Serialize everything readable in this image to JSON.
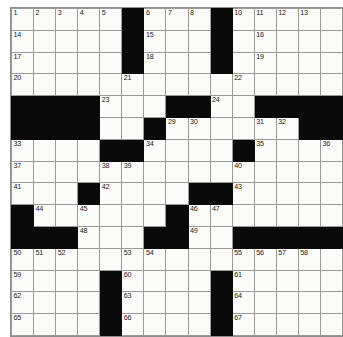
{
  "puzzle": {
    "title": "Crossword Grid",
    "size": {
      "rows": 15,
      "cols": 15
    },
    "colors": {
      "block": "#0a0a0a",
      "cell": "#fbfbf9",
      "gridline": "#9a9a9a",
      "number_text": "#1a1a1a",
      "page_background": "#ffffff"
    },
    "layout": {
      "grid_left_px": 11,
      "grid_top_px": 8,
      "cell_size_px": 21.4
    },
    "legend": {
      "block_symbol": "#",
      "open_symbol": "."
    },
    "grid_pattern": [
      ".....#....#.....",
      ".....#....#.....",
      ".....#....#.....",
      "...............",
      "####...##..#####",
      "....#.#....##..#",
      "....##....#...#.",
      "...............",
      "...#.....##.....",
      "#.........#.....",
      "###..##..##.....",
      ".........#.....",
      "....#....#.....",
      "....#....#.....",
      "....#....#....."
    ],
    "blocks": [
      [
        0,
        5
      ],
      [
        0,
        9
      ],
      [
        1,
        5
      ],
      [
        1,
        9
      ],
      [
        2,
        5
      ],
      [
        2,
        9
      ],
      [
        4,
        0
      ],
      [
        4,
        1
      ],
      [
        4,
        2
      ],
      [
        4,
        3
      ],
      [
        4,
        7
      ],
      [
        4,
        8
      ],
      [
        4,
        11
      ],
      [
        4,
        12
      ],
      [
        4,
        13
      ],
      [
        4,
        14
      ],
      [
        5,
        0
      ],
      [
        5,
        1
      ],
      [
        5,
        2
      ],
      [
        5,
        3
      ],
      [
        5,
        6
      ],
      [
        5,
        13
      ],
      [
        5,
        14
      ],
      [
        6,
        4
      ],
      [
        6,
        5
      ],
      [
        6,
        10
      ],
      [
        8,
        3
      ],
      [
        8,
        8
      ],
      [
        8,
        9
      ],
      [
        9,
        0
      ],
      [
        9,
        7
      ],
      [
        10,
        0
      ],
      [
        10,
        1
      ],
      [
        10,
        2
      ],
      [
        10,
        6
      ],
      [
        10,
        7
      ],
      [
        10,
        10
      ],
      [
        10,
        11
      ],
      [
        10,
        12
      ],
      [
        10,
        13
      ],
      [
        10,
        14
      ],
      [
        12,
        4
      ],
      [
        12,
        9
      ],
      [
        13,
        4
      ],
      [
        13,
        9
      ],
      [
        14,
        4
      ],
      [
        14,
        9
      ]
    ],
    "numbers": [
      {
        "row": 0,
        "col": 0,
        "n": "1"
      },
      {
        "row": 0,
        "col": 1,
        "n": "2"
      },
      {
        "row": 0,
        "col": 2,
        "n": "3"
      },
      {
        "row": 0,
        "col": 3,
        "n": "4"
      },
      {
        "row": 0,
        "col": 4,
        "n": "5"
      },
      {
        "row": 0,
        "col": 6,
        "n": "6"
      },
      {
        "row": 0,
        "col": 7,
        "n": "7"
      },
      {
        "row": 0,
        "col": 8,
        "n": "8"
      },
      {
        "row": 0,
        "col": 9,
        "n": "9"
      },
      {
        "row": 0,
        "col": 10,
        "n": "10"
      },
      {
        "row": 0,
        "col": 11,
        "n": "11"
      },
      {
        "row": 0,
        "col": 12,
        "n": "12"
      },
      {
        "row": 0,
        "col": 13,
        "n": "13"
      },
      {
        "row": 1,
        "col": 0,
        "n": "14"
      },
      {
        "row": 1,
        "col": 6,
        "n": "15"
      },
      {
        "row": 1,
        "col": 11,
        "n": "16"
      },
      {
        "row": 2,
        "col": 0,
        "n": "17"
      },
      {
        "row": 2,
        "col": 6,
        "n": "18"
      },
      {
        "row": 2,
        "col": 11,
        "n": "19"
      },
      {
        "row": 3,
        "col": 0,
        "n": "20"
      },
      {
        "row": 3,
        "col": 5,
        "n": "21"
      },
      {
        "row": 3,
        "col": 10,
        "n": "22"
      },
      {
        "row": 4,
        "col": 4,
        "n": "23"
      },
      {
        "row": 4,
        "col": 9,
        "n": "24"
      },
      {
        "row": 5,
        "col": 0,
        "n": "25"
      },
      {
        "row": 5,
        "col": 1,
        "n": "26"
      },
      {
        "row": 5,
        "col": 2,
        "n": "27"
      },
      {
        "row": 5,
        "col": 3,
        "n": "28"
      },
      {
        "row": 5,
        "col": 7,
        "n": "29"
      },
      {
        "row": 5,
        "col": 8,
        "n": "30"
      },
      {
        "row": 5,
        "col": 11,
        "n": "31"
      },
      {
        "row": 5,
        "col": 12,
        "n": "32"
      },
      {
        "row": 6,
        "col": 0,
        "n": "33"
      },
      {
        "row": 6,
        "col": 6,
        "n": "34"
      },
      {
        "row": 6,
        "col": 11,
        "n": "35"
      },
      {
        "row": 6,
        "col": 14,
        "n": "36"
      },
      {
        "row": 7,
        "col": 0,
        "n": "37"
      },
      {
        "row": 7,
        "col": 4,
        "n": "38"
      },
      {
        "row": 7,
        "col": 5,
        "n": "39"
      },
      {
        "row": 7,
        "col": 10,
        "n": "40"
      },
      {
        "row": 8,
        "col": 0,
        "n": "41"
      },
      {
        "row": 8,
        "col": 4,
        "n": "42"
      },
      {
        "row": 8,
        "col": 10,
        "n": "43"
      },
      {
        "row": 9,
        "col": 1,
        "n": "44"
      },
      {
        "row": 9,
        "col": 3,
        "n": "45"
      },
      {
        "row": 9,
        "col": 8,
        "n": "46"
      },
      {
        "row": 9,
        "col": 9,
        "n": "47"
      },
      {
        "row": 10,
        "col": 3,
        "n": "48"
      },
      {
        "row": 10,
        "col": 8,
        "n": "49"
      },
      {
        "row": 11,
        "col": 0,
        "n": "50"
      },
      {
        "row": 11,
        "col": 1,
        "n": "51"
      },
      {
        "row": 11,
        "col": 2,
        "n": "52"
      },
      {
        "row": 11,
        "col": 5,
        "n": "53"
      },
      {
        "row": 11,
        "col": 6,
        "n": "54"
      },
      {
        "row": 11,
        "col": 10,
        "n": "55"
      },
      {
        "row": 11,
        "col": 11,
        "n": "56"
      },
      {
        "row": 11,
        "col": 12,
        "n": "57"
      },
      {
        "row": 11,
        "col": 13,
        "n": "58"
      },
      {
        "row": 12,
        "col": 0,
        "n": "59"
      },
      {
        "row": 12,
        "col": 5,
        "n": "60"
      },
      {
        "row": 12,
        "col": 10,
        "n": "61"
      },
      {
        "row": 13,
        "col": 0,
        "n": "62"
      },
      {
        "row": 13,
        "col": 5,
        "n": "63"
      },
      {
        "row": 13,
        "col": 10,
        "n": "64"
      },
      {
        "row": 14,
        "col": 0,
        "n": "65"
      },
      {
        "row": 14,
        "col": 5,
        "n": "66"
      },
      {
        "row": 14,
        "col": 10,
        "n": "67"
      }
    ],
    "entries": []
  }
}
